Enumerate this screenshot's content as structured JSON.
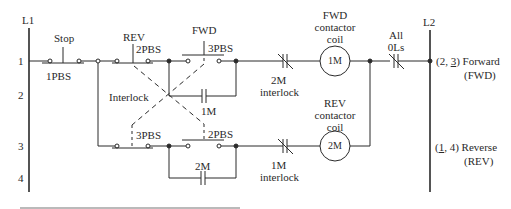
{
  "rails": {
    "left": "L1",
    "right": "L2"
  },
  "rows": [
    "1",
    "2",
    "3",
    "4"
  ],
  "rung1": {
    "stop_label": "Stop",
    "stop_pb": "1PBS",
    "rev_label": "REV",
    "rev_pb": "2PBS",
    "fwd_label": "FWD",
    "fwd_pb": "3PBS",
    "seal_contact": "1M",
    "interlock_contact": "2M",
    "interlock_text": "interlock",
    "coil": "1M",
    "coil_caption": [
      "FWD",
      "contactor",
      "coil"
    ],
    "overload_caption": [
      "All",
      "0Ls"
    ],
    "output_ref_open": "(2, ",
    "output_ref_underlined": "3",
    "output_ref_close": ")",
    "output_name": "Forward",
    "output_abbr": "(FWD)"
  },
  "interlock_label": "Interlock",
  "rung3": {
    "fwd_pb": "3PBS",
    "rev_pb": "2PBS",
    "seal_contact": "2M",
    "interlock_contact": "1M",
    "interlock_text": "interlock",
    "coil": "2M",
    "coil_caption": [
      "REV",
      "contactor",
      "coil"
    ],
    "output_ref_open": "(",
    "output_ref_underlined": "1",
    "output_ref_close": ", 4)",
    "output_name": "Reverse",
    "output_abbr": "(REV)"
  },
  "colors": {
    "line": "#2a2a2a",
    "background": "#ffffff"
  }
}
